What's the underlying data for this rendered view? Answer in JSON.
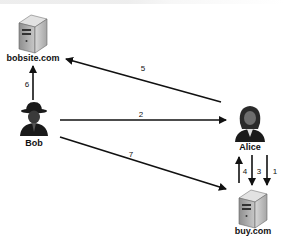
{
  "diagram": {
    "nodes": {
      "bobsite": {
        "label": "bobsite.com",
        "icon": "server-icon"
      },
      "bob": {
        "label": "Bob",
        "icon": "attacker-person-icon"
      },
      "alice": {
        "label": "Alice",
        "icon": "user-person-icon"
      },
      "buy": {
        "label": "buy.com",
        "icon": "server-icon"
      }
    },
    "edges": [
      {
        "id": "1",
        "label": "1",
        "from": "Alice",
        "to": "buy.com"
      },
      {
        "id": "2",
        "label": "2",
        "from": "Bob",
        "to": "Alice"
      },
      {
        "id": "3",
        "label": "3",
        "from": "Alice",
        "to": "buy.com"
      },
      {
        "id": "4",
        "label": "4",
        "from": "buy.com",
        "to": "Alice"
      },
      {
        "id": "5",
        "label": "5",
        "from": "Alice",
        "to": "bobsite.com"
      },
      {
        "id": "6",
        "label": "6",
        "from": "Bob",
        "to": "bobsite.com"
      },
      {
        "id": "7",
        "label": "7",
        "from": "Bob",
        "to": "buy.com"
      }
    ],
    "colors": {
      "line": "#111111",
      "server": "#b8b8b8",
      "figure": "#1a1a1a"
    }
  }
}
